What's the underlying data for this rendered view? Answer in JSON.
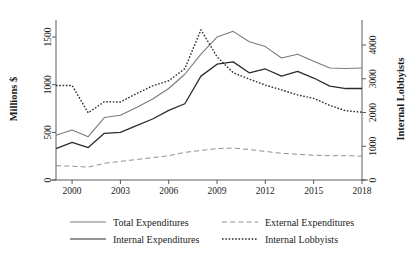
{
  "chart_data": {
    "type": "line",
    "title": "",
    "subtitle": "",
    "xlabel": "",
    "ylabel": "Millions $",
    "y2label": "Internal Lobbyists",
    "grid": false,
    "legend_position": "bottom",
    "xlim": [
      1999,
      2018
    ],
    "ylim": [
      0,
      1700
    ],
    "y2lim": [
      0,
      4800
    ],
    "x_ticks": [
      "2000",
      "2003",
      "2006",
      "2009",
      "2012",
      "2015",
      "2018"
    ],
    "x_tick_values": [
      2000,
      2003,
      2006,
      2009,
      2012,
      2015,
      2018
    ],
    "y_ticks": [
      "0",
      "500",
      "1000",
      "1500"
    ],
    "y_tick_values": [
      0,
      500,
      1000,
      1500
    ],
    "y2_ticks": [
      "0",
      "1000",
      "2000",
      "3000",
      "4000"
    ],
    "y2_tick_values": [
      0,
      1000,
      2000,
      3000,
      4000
    ],
    "x": [
      1999,
      2000,
      2001,
      2002,
      2003,
      2004,
      2005,
      2006,
      2007,
      2008,
      2009,
      2010,
      2011,
      2012,
      2013,
      2014,
      2015,
      2016,
      2017,
      2018
    ],
    "series": [
      {
        "name": "Total Expenditures",
        "axis": "left",
        "style": "solid",
        "color": "#7a7a7a",
        "width": 1.1,
        "values": [
          470,
          525,
          455,
          655,
          680,
          760,
          850,
          960,
          1110,
          1320,
          1500,
          1560,
          1450,
          1400,
          1280,
          1320,
          1245,
          1175,
          1170,
          1175
        ]
      },
      {
        "name": "Internal Expenditures",
        "axis": "left",
        "style": "solid",
        "color": "#2b2b2b",
        "width": 1.3,
        "values": [
          330,
          395,
          340,
          490,
          500,
          570,
          640,
          730,
          800,
          1090,
          1215,
          1240,
          1125,
          1165,
          1090,
          1140,
          1070,
          985,
          960,
          960
        ]
      },
      {
        "name": "External Expenditures",
        "axis": "left",
        "style": "dashed",
        "color": "#8d8d8d",
        "width": 1.0,
        "values": [
          150,
          145,
          135,
          175,
          195,
          215,
          235,
          255,
          290,
          310,
          330,
          335,
          320,
          300,
          280,
          270,
          260,
          255,
          255,
          250
        ]
      },
      {
        "name": "Internal Lobbyists",
        "axis": "right",
        "style": "dotted",
        "color": "#2b2b2b",
        "width": 1.4,
        "values": [
          2800,
          2800,
          1990,
          2320,
          2310,
          2560,
          2790,
          2940,
          3300,
          4450,
          3650,
          3180,
          2990,
          2810,
          2670,
          2520,
          2420,
          2210,
          2050,
          2010
        ]
      }
    ],
    "legend": [
      {
        "label": "Total Expenditures",
        "style": "solid",
        "color": "#7a7a7a"
      },
      {
        "label": "External Expenditures",
        "style": "dashed",
        "color": "#8d8d8d"
      },
      {
        "label": "Internal Expenditures",
        "style": "solid",
        "color": "#2b2b2b"
      },
      {
        "label": "Internal Lobbyists",
        "style": "dotted",
        "color": "#2b2b2b"
      }
    ]
  }
}
